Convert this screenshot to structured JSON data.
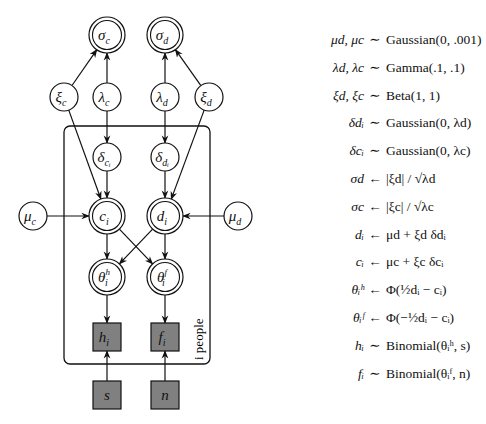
{
  "diagram": {
    "nodes": [
      {
        "id": "sigma_c",
        "label": "σ",
        "sub": "c",
        "sup": "",
        "type": "deterministic",
        "cx": 107,
        "cy": 35
      },
      {
        "id": "sigma_d",
        "label": "σ",
        "sub": "d",
        "sup": "",
        "type": "deterministic",
        "cx": 165,
        "cy": 35
      },
      {
        "id": "xi_c",
        "label": "ξ",
        "sub": "c",
        "sup": "",
        "type": "stochastic",
        "cx": 64,
        "cy": 97
      },
      {
        "id": "lambda_c",
        "label": "λ",
        "sub": "c",
        "sup": "",
        "type": "stochastic",
        "cx": 107,
        "cy": 97
      },
      {
        "id": "lambda_d",
        "label": "λ",
        "sub": "d",
        "sup": "",
        "type": "stochastic",
        "cx": 165,
        "cy": 97
      },
      {
        "id": "xi_d",
        "label": "ξ",
        "sub": "d",
        "sup": "",
        "type": "stochastic",
        "cx": 209,
        "cy": 97
      },
      {
        "id": "delta_c",
        "label": "δ",
        "sub": "cᵢ",
        "sup": "",
        "type": "stochastic",
        "cx": 107,
        "cy": 157
      },
      {
        "id": "delta_d",
        "label": "δ",
        "sub": "dᵢ",
        "sup": "",
        "type": "stochastic",
        "cx": 165,
        "cy": 157
      },
      {
        "id": "mu_c",
        "label": "μ",
        "sub": "c",
        "sup": "",
        "type": "stochastic",
        "cx": 33,
        "cy": 216
      },
      {
        "id": "c_i",
        "label": "c",
        "sub": "i",
        "sup": "",
        "type": "deterministic",
        "cx": 107,
        "cy": 216
      },
      {
        "id": "d_i",
        "label": "d",
        "sub": "i",
        "sup": "",
        "type": "deterministic",
        "cx": 165,
        "cy": 216
      },
      {
        "id": "mu_d",
        "label": "μ",
        "sub": "d",
        "sup": "",
        "type": "stochastic",
        "cx": 238,
        "cy": 216
      },
      {
        "id": "theta_h",
        "label": "θ",
        "sub": "i",
        "sup": "h",
        "type": "deterministic",
        "cx": 107,
        "cy": 277
      },
      {
        "id": "theta_f",
        "label": "θ",
        "sub": "i",
        "sup": "f",
        "type": "deterministic",
        "cx": 165,
        "cy": 277
      },
      {
        "id": "h_i",
        "label": "h",
        "sub": "i",
        "sup": "",
        "type": "observed",
        "cx": 107,
        "cy": 337
      },
      {
        "id": "f_i",
        "label": "f",
        "sub": "i",
        "sup": "",
        "type": "observed",
        "cx": 165,
        "cy": 337
      },
      {
        "id": "s",
        "label": "s",
        "sub": "",
        "sup": "",
        "type": "observed",
        "cx": 107,
        "cy": 395
      },
      {
        "id": "n",
        "label": "n",
        "sub": "",
        "sup": "",
        "type": "observed",
        "cx": 165,
        "cy": 395
      }
    ],
    "edges": [
      [
        "xi_c",
        "sigma_c"
      ],
      [
        "lambda_c",
        "sigma_c"
      ],
      [
        "lambda_d",
        "sigma_d"
      ],
      [
        "xi_d",
        "sigma_d"
      ],
      [
        "lambda_c",
        "delta_c"
      ],
      [
        "lambda_d",
        "delta_d"
      ],
      [
        "xi_c",
        "c_i"
      ],
      [
        "delta_c",
        "c_i"
      ],
      [
        "delta_d",
        "d_i"
      ],
      [
        "xi_d",
        "d_i"
      ],
      [
        "mu_c",
        "c_i"
      ],
      [
        "mu_d",
        "d_i"
      ],
      [
        "c_i",
        "theta_h"
      ],
      [
        "c_i",
        "theta_f"
      ],
      [
        "d_i",
        "theta_h"
      ],
      [
        "d_i",
        "theta_f"
      ],
      [
        "theta_h",
        "h_i"
      ],
      [
        "theta_f",
        "f_i"
      ],
      [
        "s",
        "h_i"
      ],
      [
        "n",
        "f_i"
      ]
    ],
    "plate": {
      "label": "i people",
      "x": 64,
      "y": 126,
      "width": 146,
      "height": 238
    }
  },
  "equations": [
    {
      "lhs": "μd, μc",
      "op": "∼",
      "rhs": "Gaussian(0, .001)"
    },
    {
      "lhs": "λd, λc",
      "op": "∼",
      "rhs": "Gamma(.1, .1)"
    },
    {
      "lhs": "ξd, ξc",
      "op": "∼",
      "rhs": "Beta(1, 1)"
    },
    {
      "lhs": "δdᵢ",
      "op": "∼",
      "rhs": "Gaussian(0, λd)"
    },
    {
      "lhs": "δcᵢ",
      "op": "∼",
      "rhs": "Gaussian(0, λc)"
    },
    {
      "lhs": "σd",
      "op": "←",
      "rhs": "|ξd| / √λd"
    },
    {
      "lhs": "σc",
      "op": "←",
      "rhs": "|ξc| / √λc"
    },
    {
      "lhs": "dᵢ",
      "op": "←",
      "rhs": "μd + ξd δdᵢ"
    },
    {
      "lhs": "cᵢ",
      "op": "←",
      "rhs": "μc + ξc δcᵢ"
    },
    {
      "lhs": "θᵢʰ",
      "op": "←",
      "rhs": "Φ(½dᵢ − cᵢ)"
    },
    {
      "lhs": "θᵢᶠ",
      "op": "←",
      "rhs": "Φ(−½dᵢ − cᵢ)"
    },
    {
      "lhs": "hᵢ",
      "op": "∼",
      "rhs": "Binomial(θᵢʰ, s)"
    },
    {
      "lhs": "fᵢ",
      "op": "∼",
      "rhs": "Binomial(θᵢᶠ, n)"
    }
  ],
  "colors": {
    "observed_fill": "#808080",
    "stroke": "#111111",
    "background": "#ffffff"
  }
}
